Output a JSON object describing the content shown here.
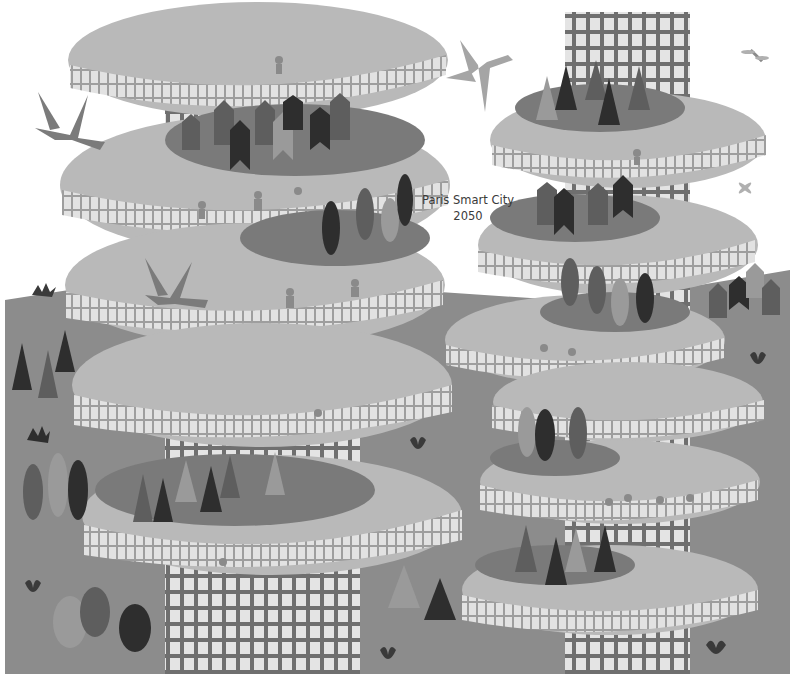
{
  "caption": {
    "line1": "Paris Smart City",
    "line2": "2050"
  },
  "palette": {
    "ground": "#8c8c8c",
    "disc": "#b9b9b9",
    "disc_rim": "#c6c6c6",
    "window": "#e2e2e2",
    "window_frame": "#9e9e9e",
    "garden": "#7a7a7a",
    "tree_dark": "#2e2e2e",
    "tree_mid": "#5e5e5e",
    "tree_light": "#9a9a9a",
    "tower": "#6f6f6f",
    "bird": "#7b7b7b",
    "bird_light": "#a5a5a5"
  },
  "scene": {
    "description": "Illustration of spiral tower buildings with terraced gardens, trees, birds and people",
    "towers": 2,
    "birds": 3,
    "dragonflies": 2
  }
}
